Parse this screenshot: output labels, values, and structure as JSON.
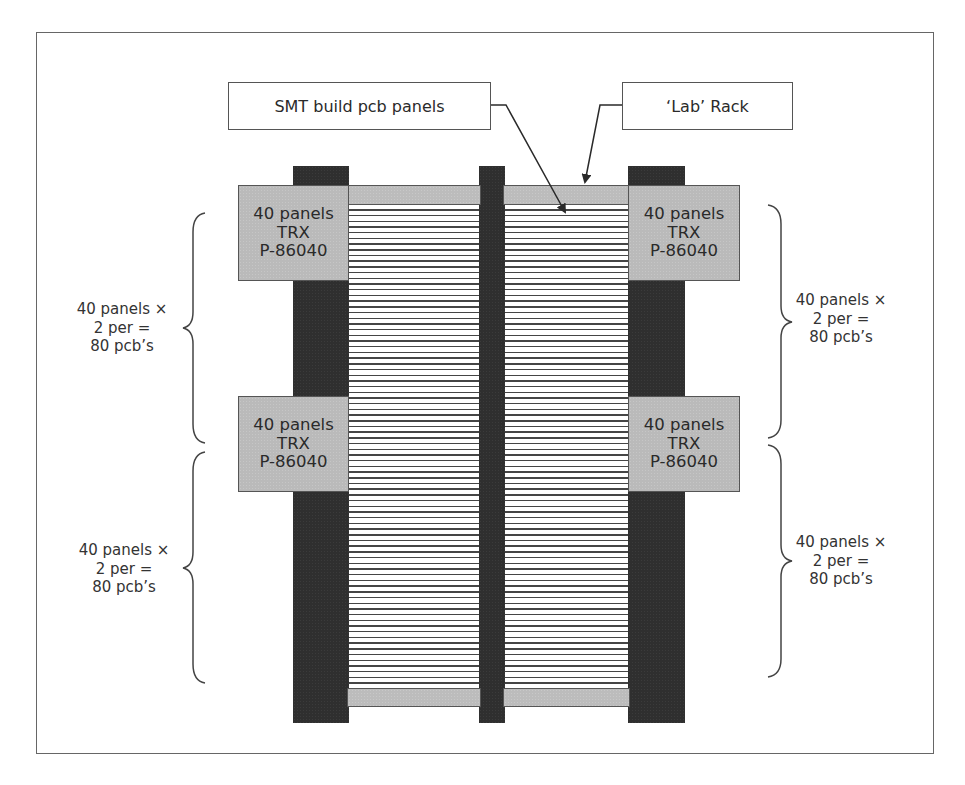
{
  "diagram": {
    "callouts": {
      "smt": {
        "label": "SMT build pcb panels"
      },
      "lab": {
        "label": "‘Lab’ Rack"
      }
    },
    "trx_boxes": [
      {
        "position": "top-left",
        "line1": "40 panels",
        "line2": "TRX",
        "line3": "P-86040"
      },
      {
        "position": "top-right",
        "line1": "40 panels",
        "line2": "TRX",
        "line3": "P-86040"
      },
      {
        "position": "bottom-left",
        "line1": "40 panels",
        "line2": "TRX",
        "line3": "P-86040"
      },
      {
        "position": "bottom-right",
        "line1": "40 panels",
        "line2": "TRX",
        "line3": "P-86040"
      }
    ],
    "bracket_labels": [
      {
        "position": "upper-left",
        "line1": "40 panels ×",
        "line2": "2 per =",
        "line3": "80 pcb’s"
      },
      {
        "position": "lower-left",
        "line1": "40 panels ×",
        "line2": "2 per =",
        "line3": "80 pcb’s"
      },
      {
        "position": "upper-right",
        "line1": "40 panels ×",
        "line2": "2 per =",
        "line3": "80 pcb’s"
      },
      {
        "position": "lower-right",
        "line1": "40 panels ×",
        "line2": "2 per =",
        "line3": "80 pcb’s"
      }
    ],
    "colors": {
      "post": "#2f2f2f",
      "rack_gray": "#bcbcbc",
      "pcb_line": "#454545",
      "border": "#555555",
      "frame": "#666666"
    }
  }
}
